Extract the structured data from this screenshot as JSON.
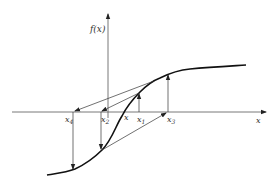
{
  "diagram": {
    "type": "newton-method-oscillation",
    "y_axis_label": "f(x)",
    "x_axis_label": "x",
    "points": [
      {
        "name": "x4",
        "label": "x",
        "sub": "4"
      },
      {
        "name": "x2",
        "label": "x",
        "sub": "2"
      },
      {
        "name": "x_root",
        "label": "x",
        "sub": ""
      },
      {
        "name": "x1",
        "label": "x",
        "sub": "1"
      },
      {
        "name": "x3",
        "label": "x",
        "sub": "3"
      }
    ],
    "colors": {
      "stroke": "#222222",
      "background": "#ffffff"
    }
  }
}
